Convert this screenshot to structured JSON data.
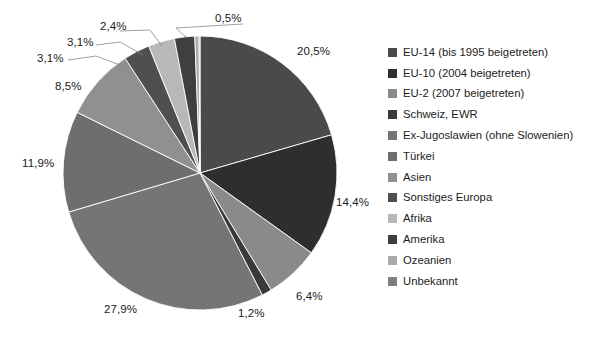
{
  "chart_data": {
    "type": "pie",
    "title": "",
    "subtitle": "",
    "xlabel": "",
    "ylabel": "",
    "legend_position": "right",
    "grid": false,
    "value_suffix": "%",
    "decimal_separator": ",",
    "categories": [
      "EU-14 (bis 1995 beigetreten)",
      "EU-10 (2004 beigetreten)",
      "EU-2 (2007 beigetreten)",
      "Schweiz, EWR",
      "Ex-Jugoslawien (ohne Slowenien)",
      "Türkei",
      "Asien",
      "Sonstiges Europa",
      "Afrika",
      "Amerika",
      "Ozeanien",
      "Unbekannt"
    ],
    "values": [
      20.5,
      14.4,
      6.4,
      1.2,
      27.9,
      11.9,
      8.5,
      3.1,
      3.1,
      2.4,
      0.5,
      0.1
    ],
    "value_labels": [
      "20,5%",
      "14,4%",
      "6,4%",
      "1,2%",
      "27,9%",
      "11,9%",
      "8,5%",
      "3,1%",
      "3,1%",
      "2,4%",
      "0,5%",
      ""
    ],
    "colors": [
      "#4a4a4a",
      "#2e2e2e",
      "#8a8a8a",
      "#3a3a3a",
      "#757575",
      "#6e6e6e",
      "#909090",
      "#4f4f4f",
      "#b8b8b8",
      "#3f3f3f",
      "#aaaaaa",
      "#808080"
    ],
    "start_angle_deg": 0,
    "direction": "clockwise"
  },
  "legend": {
    "items": [
      {
        "label": "EU-14 (bis 1995 beigetreten)",
        "color": "#4a4a4a"
      },
      {
        "label": "EU-10 (2004 beigetreten)",
        "color": "#2e2e2e"
      },
      {
        "label": "EU-2 (2007 beigetreten)",
        "color": "#8a8a8a"
      },
      {
        "label": "Schweiz, EWR",
        "color": "#3a3a3a"
      },
      {
        "label": "Ex-Jugoslawien (ohne Slowenien)",
        "color": "#757575"
      },
      {
        "label": "Türkei",
        "color": "#6e6e6e"
      },
      {
        "label": "Asien",
        "color": "#909090"
      },
      {
        "label": "Sonstiges Europa",
        "color": "#4f4f4f"
      },
      {
        "label": "Afrika",
        "color": "#b8b8b8"
      },
      {
        "label": "Amerika",
        "color": "#3f3f3f"
      },
      {
        "label": "Ozeanien",
        "color": "#aaaaaa"
      },
      {
        "label": "Unbekannt",
        "color": "#808080"
      }
    ]
  },
  "pie_labels": [
    {
      "text": "20,5%",
      "x": 297,
      "y": 45,
      "leader": false
    },
    {
      "text": "14,4%",
      "x": 336,
      "y": 196,
      "leader": false
    },
    {
      "text": "6,4%",
      "x": 296,
      "y": 290,
      "leader": false
    },
    {
      "text": "1,2%",
      "x": 238,
      "y": 307,
      "leader": false
    },
    {
      "text": "27,9%",
      "x": 104,
      "y": 303,
      "leader": false
    },
    {
      "text": "11,9%",
      "x": 22,
      "y": 157,
      "leader": false
    },
    {
      "text": "8,5%",
      "x": 55,
      "y": 80,
      "leader": false
    },
    {
      "text": "3,1%",
      "x": 37,
      "y": 52,
      "leader": true
    },
    {
      "text": "3,1%",
      "x": 67,
      "y": 36,
      "leader": true
    },
    {
      "text": "2,4%",
      "x": 100,
      "y": 20,
      "leader": true
    },
    {
      "text": "0,5%",
      "x": 215,
      "y": 12,
      "leader": true
    }
  ]
}
